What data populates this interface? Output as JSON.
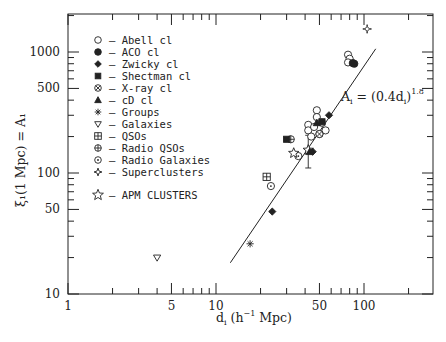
{
  "chart_data": {
    "type": "scatter",
    "title": "",
    "xlabel": "d_i (h^-1 Mpc)",
    "ylabel": "ξ_i(1 Mpc) = A_i",
    "xscale": "log",
    "yscale": "log",
    "xlim": [
      1,
      250
    ],
    "ylim": [
      10,
      2500
    ],
    "x_tick_labels": [
      "1",
      "5",
      "10",
      "50",
      "100"
    ],
    "x_ticks": [
      1,
      5,
      10,
      50,
      100
    ],
    "y_tick_labels": [
      "10",
      "50",
      "100",
      "500",
      "1000"
    ],
    "y_ticks": [
      10,
      50,
      100,
      500,
      1000
    ],
    "grid": false,
    "legend_position": "upper-left-inside",
    "fit_line": {
      "label": "A_i = (0.4d_i)^1.8",
      "label_main": "A",
      "label_sub": "i",
      "label_eq": " = (0.4d",
      "label_sub2": "i",
      "label_close": ")",
      "label_sup": "1.8",
      "coefficient": 0.4,
      "exponent": 1.8,
      "x_range": [
        12.5,
        120
      ]
    },
    "series": [
      {
        "name": "Abell cl",
        "marker": "open-circle",
        "points": [
          [
            78,
            950
          ],
          [
            80,
            880
          ],
          [
            78,
            820
          ],
          [
            48,
            330
          ],
          [
            48,
            290
          ],
          [
            42,
            250
          ],
          [
            42,
            225
          ],
          [
            46,
            240
          ],
          [
            52,
            260
          ],
          [
            55,
            225
          ],
          [
            44,
            200
          ],
          [
            50,
            210
          ]
        ]
      },
      {
        "name": "ACO cl",
        "marker": "filled-circle",
        "points": [
          [
            86,
            800
          ],
          [
            84,
            810
          ]
        ]
      },
      {
        "name": "Zwicky cl",
        "marker": "filled-diamond",
        "points": [
          [
            24,
            48
          ],
          [
            58,
            300
          ],
          [
            45,
            150
          ]
        ]
      },
      {
        "name": "Shectman cl",
        "marker": "filled-square",
        "points": [
          [
            30,
            190
          ],
          [
            52,
            265
          ]
        ]
      },
      {
        "name": "X-ray cl",
        "marker": "circle-x",
        "points": [
          [
            50,
            210
          ]
        ]
      },
      {
        "name": "cD cl",
        "marker": "filled-triangle",
        "points": [
          [
            48,
            260
          ],
          [
            43,
            150
          ]
        ]
      },
      {
        "name": "Groups",
        "marker": "asterisk",
        "points": [
          [
            17,
            26
          ]
        ]
      },
      {
        "name": "Galaxies",
        "marker": "open-triangle-down",
        "points": [
          [
            4,
            20
          ]
        ]
      },
      {
        "name": "QSOs",
        "marker": "square-plus",
        "points": [
          [
            22,
            93
          ]
        ]
      },
      {
        "name": "Radio QSOs",
        "marker": "circle-plus",
        "points": [
          [
            32,
            190
          ]
        ]
      },
      {
        "name": "Radio Galaxies",
        "marker": "circle-dot",
        "points": [
          [
            23.5,
            78
          ],
          [
            36,
            138
          ]
        ]
      },
      {
        "name": "Superclusters",
        "marker": "four-point-star",
        "points": [
          [
            105,
            1550
          ]
        ]
      },
      {
        "name": "APM CLUSTERS",
        "marker": "open-star",
        "points": [
          [
            33.5,
            146
          ],
          [
            42,
            155
          ]
        ],
        "error_bar": {
          "x": 42,
          "low": 110,
          "high": 205
        }
      }
    ]
  },
  "legend": {
    "items": [
      {
        "marker": "open-circle",
        "label": "– Abell cl"
      },
      {
        "marker": "filled-circle",
        "label": "– ACO cl"
      },
      {
        "marker": "filled-diamond",
        "label": "– Zwicky cl"
      },
      {
        "marker": "filled-square",
        "label": "– Shectman cl"
      },
      {
        "marker": "circle-x",
        "label": "– X-ray cl"
      },
      {
        "marker": "filled-triangle",
        "label": "– cD cl"
      },
      {
        "marker": "asterisk",
        "label": "– Groups"
      },
      {
        "marker": "open-triangle-down",
        "label": "– Galaxies"
      },
      {
        "marker": "square-plus",
        "label": "– QSOs"
      },
      {
        "marker": "circle-plus",
        "label": "– Radio QSOs"
      },
      {
        "marker": "circle-dot",
        "label": "– Radio Galaxies"
      },
      {
        "marker": "four-point-star",
        "label": "– Superclusters"
      }
    ],
    "apm": {
      "marker": "open-star",
      "label": "– APM CLUSTERS"
    }
  },
  "axes": {
    "y_title": "ξ₁(1 Mpc) = A₁",
    "x_title_main": "d",
    "x_title_sub": "i",
    "x_title_rest": " (h",
    "x_title_sup": "−1",
    "x_title_end": " Mpc)"
  }
}
